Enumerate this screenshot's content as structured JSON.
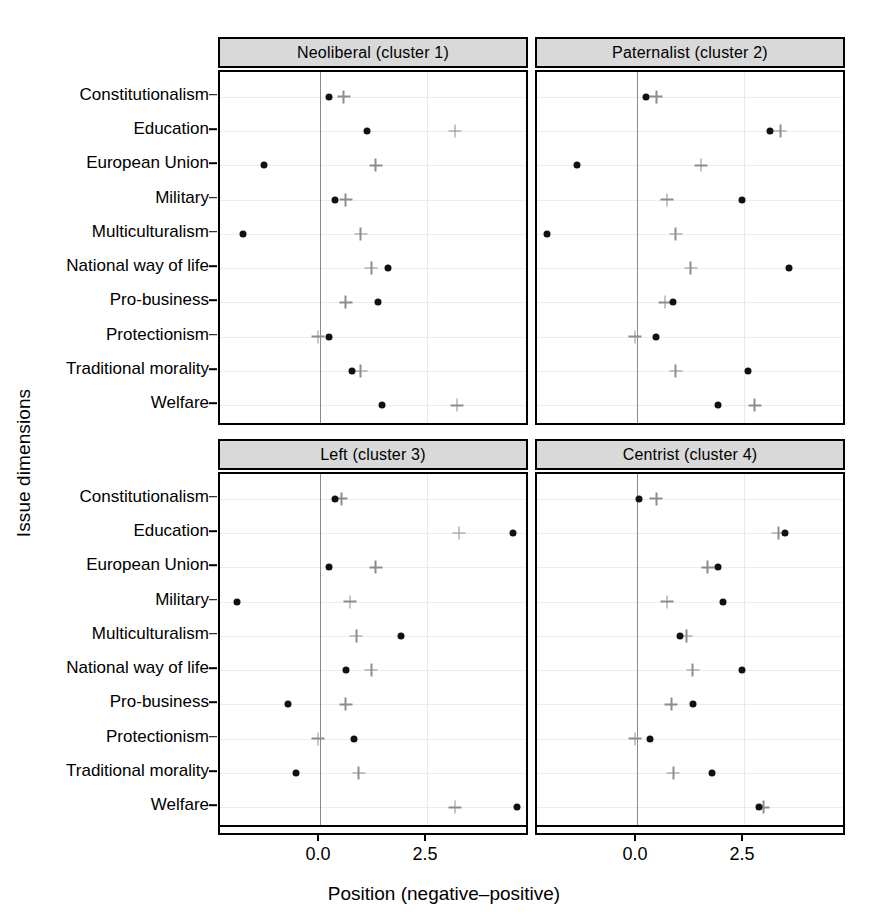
{
  "chart_data": {
    "type": "scatter",
    "title": "",
    "xlabel": "Position (negative–positive)",
    "ylabel": "Issue dimensions",
    "xlim": [
      -2.0,
      5.6
    ],
    "xticks": [
      0.0,
      2.5,
      5.0
    ],
    "xticklabels": [
      "0.0",
      "2.5",
      "5.0"
    ],
    "grid": true,
    "legend_position": "none",
    "series_names": [
      "party position (dot)",
      "voter position (plus)"
    ],
    "categories": [
      "Constitutionalism",
      "Education",
      "European Union",
      "Military",
      "Multiculturalism",
      "National way of life",
      "Pro-business",
      "Protectionism",
      "Traditional morality",
      "Welfare"
    ],
    "panels": [
      {
        "label": "Neoliberal (cluster 1)",
        "dot": [
          0.2,
          1.1,
          -1.3,
          0.35,
          -1.8,
          1.6,
          1.35,
          0.2,
          0.75,
          1.45
        ],
        "plus": [
          0.55,
          3.15,
          1.3,
          0.6,
          0.95,
          1.2,
          0.6,
          -0.05,
          0.95,
          3.2
        ]
      },
      {
        "label": "Paternalist (cluster 2)",
        "dot": [
          0.2,
          3.1,
          -1.4,
          2.45,
          -2.1,
          3.55,
          0.85,
          0.45,
          2.6,
          1.9
        ],
        "plus": [
          0.45,
          3.35,
          1.5,
          0.7,
          0.9,
          1.25,
          0.65,
          -0.05,
          0.9,
          2.75
        ]
      },
      {
        "label": "Left (cluster 3)",
        "dot": [
          0.35,
          4.5,
          0.2,
          -1.95,
          1.9,
          0.6,
          -0.75,
          0.8,
          -0.55,
          4.6
        ],
        "plus": [
          0.5,
          3.25,
          1.3,
          0.7,
          0.85,
          1.2,
          0.6,
          -0.05,
          0.9,
          3.15
        ]
      },
      {
        "label": "Centrist (cluster 4)",
        "dot": [
          0.05,
          3.45,
          1.9,
          2.0,
          1.0,
          2.45,
          1.3,
          0.3,
          1.75,
          2.85
        ],
        "plus": [
          0.45,
          3.3,
          1.65,
          0.7,
          1.15,
          1.3,
          0.8,
          -0.05,
          0.85,
          2.95
        ]
      }
    ]
  },
  "axes": {
    "ylabel": "Issue dimensions",
    "xlabel": "Position (negative–positive)",
    "xticklabels": [
      "0.0",
      "2.5",
      "5.0"
    ]
  },
  "colors": {
    "dot": "#111111",
    "plus": "#8d8d8d",
    "strip_bg": "#d9d9d9",
    "panel_border": "#000000",
    "grid": "#ededed",
    "zeroline": "#8a8a8a"
  }
}
